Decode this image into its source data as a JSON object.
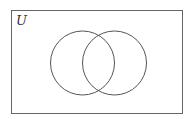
{
  "diagram": {
    "type": "venn",
    "universe_label": "U",
    "sets": [
      {
        "name": "left-set",
        "cx": 82.5,
        "cy": 63,
        "r": 32
      },
      {
        "name": "right-set",
        "cx": 114.5,
        "cy": 63,
        "r": 32
      }
    ],
    "stroke_color": "#555555",
    "border_color": "#666666"
  }
}
